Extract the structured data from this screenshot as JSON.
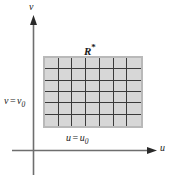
{
  "figure": {
    "title": "",
    "background_color": "#ffffff",
    "axes": {
      "vertical": {
        "label": "v",
        "name": "v-axis"
      },
      "horizontal": {
        "label": "u",
        "name": "u-axis"
      },
      "line_color": "#6e6e6e"
    },
    "region": {
      "label_text": "R",
      "label_star": "*",
      "fill_color": "#d7d7d7",
      "border_color": "#b9b9b9",
      "gridline_color": "#3a3a3a",
      "columns": 7,
      "rows": 6
    },
    "annotations": {
      "u_line": {
        "lhs": "u",
        "eq": "=",
        "rhs": "u",
        "subscript": "0"
      },
      "v_line": {
        "lhs": "v",
        "eq": "=",
        "rhs": "v",
        "subscript": "0"
      }
    }
  }
}
